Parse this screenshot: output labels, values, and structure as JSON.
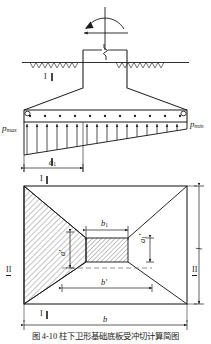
{
  "figure": {
    "title_number": "图 4-10",
    "caption": "柱下卫形基础底板受冲切计算简图",
    "caption_full": "图 4-10   柱下卫形基础底板受冲切计算简图",
    "views": [
      {
        "name": "elevation",
        "label": "elevation-view"
      },
      {
        "name": "plan",
        "label": "plan-view"
      }
    ]
  },
  "elevation": {
    "loads": {
      "moment_arc": "moment-arrow",
      "horizontal_force": "horizontal-force-arrow",
      "vertical_axis": "column-axis-line"
    },
    "ground": {
      "hatch_label": "ground-surface-hatching"
    },
    "pressure": {
      "left_label": "p",
      "left_sub": "max",
      "right_label": "p",
      "right_sub": "min",
      "arrow_count": 16,
      "bearing_dots": 11
    },
    "section_mark": "I"
  },
  "plan": {
    "dimensions": [
      {
        "id": "a1",
        "base": "a",
        "sub": "1",
        "orient": "horizontal",
        "pos": "top-left"
      },
      {
        "id": "b1",
        "base": "b",
        "sub": "1",
        "orient": "horizontal",
        "pos": "center-top"
      },
      {
        "id": "a1prime",
        "base": "a",
        "sub": "1",
        "prime": "'",
        "orient": "vertical",
        "pos": "center-right"
      },
      {
        "id": "aprime",
        "base": "a",
        "sub": "",
        "prime": "'",
        "orient": "vertical",
        "pos": "left-inner"
      },
      {
        "id": "bprime",
        "base": "b",
        "sub": "",
        "prime": "'",
        "orient": "horizontal",
        "pos": "bottom-inner"
      },
      {
        "id": "b",
        "base": "b",
        "sub": "",
        "orient": "horizontal",
        "pos": "bottom"
      },
      {
        "id": "l",
        "base": "l",
        "sub": "",
        "orient": "vertical",
        "pos": "right"
      }
    ],
    "section_marks": [
      {
        "id": "left",
        "text": "II"
      },
      {
        "id": "right",
        "text": "II"
      },
      {
        "id": "top",
        "text": "I"
      },
      {
        "id": "bottom",
        "text": "I"
      }
    ],
    "hatched_regions": [
      {
        "id": "left-trapezoid",
        "label": "punching-shear-area-left"
      },
      {
        "id": "center-column",
        "label": "column-footprint"
      }
    ]
  },
  "colors": {
    "line": "#1a1a1a",
    "hatch": "#555555",
    "dash": "#777777",
    "background": "#ffffff"
  }
}
